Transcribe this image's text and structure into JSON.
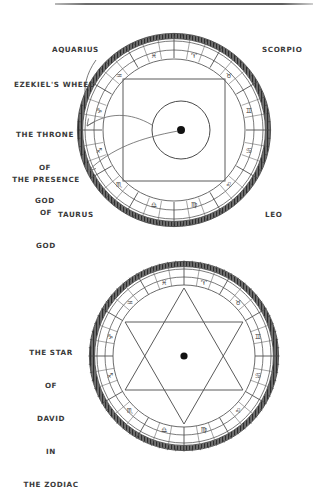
{
  "page": {
    "background": "#ffffff",
    "ink": "#3a3a3a",
    "rule_color": "#6d6d6d"
  },
  "diagrams": [
    {
      "id": "ezekiels-wheel",
      "title_labels": {
        "aquarius": "AQUARIUS",
        "scorpio": "SCORPIO",
        "taurus": "TAURUS",
        "leo": "LEO"
      },
      "callouts": [
        {
          "id": "ezekiels-wheel",
          "lines": [
            "EZEKIEL'S WHEEL"
          ]
        },
        {
          "id": "throne-of-god",
          "lines": [
            "THE THRONE",
            "OF",
            "GOD"
          ]
        },
        {
          "id": "presence-of-god",
          "lines": [
            "THE PRESENCE",
            "OF",
            "GOD"
          ]
        }
      ],
      "geometry": {
        "cx": 174,
        "cy": 130,
        "outer_r": 96,
        "band_outer_r": 92,
        "band_inner_r": 72,
        "inscribed_square": true,
        "inner_circle_r": 37,
        "center_dot_r": 4
      }
    },
    {
      "id": "star-of-david-zodiac",
      "callouts": [
        {
          "id": "star-of-david",
          "lines": [
            "THE STAR",
            "OF",
            "DAVID",
            "IN",
            "THE ZODIAC"
          ]
        }
      ],
      "geometry": {
        "cx": 184,
        "cy": 356,
        "outer_r": 95,
        "band_outer_r": 91,
        "band_inner_r": 71,
        "hexagram": true,
        "hexagram_r": 68,
        "center_dot_r": 3.5
      }
    }
  ],
  "zodiac_glyphs": [
    "♈",
    "♉",
    "♊",
    "♋",
    "♌",
    "♍",
    "♎",
    "♏",
    "♐",
    "♑",
    "♒",
    "♓"
  ],
  "labels": {
    "aquarius": "AQUARIUS",
    "scorpio": "SCORPIO",
    "taurus": "TAURUS",
    "leo": "LEO",
    "ezekiels_wheel": "EZEKIEL'S WHEEL",
    "throne_line1": "THE THRONE",
    "throne_line2": "OF",
    "throne_line3": "GOD",
    "presence_line1": "THE PRESENCE",
    "presence_line2": "OF",
    "presence_line3": "GOD",
    "star_line1": "THE STAR",
    "star_line2": "OF",
    "star_line3": "DAVID",
    "star_line4": "IN",
    "star_line5": "THE ZODIAC"
  }
}
